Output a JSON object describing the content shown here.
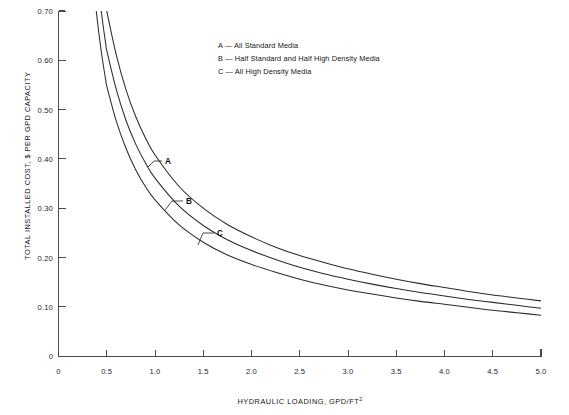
{
  "chart_data": {
    "type": "line",
    "title": "",
    "xlabel": "HYDRAULIC LOADING, GPD/FT",
    "xlabel_superscript": "2",
    "ylabel": "TOTAL INSTALLED COST, $ PER GPD CAPACITY",
    "xlim": [
      0,
      5.0
    ],
    "ylim": [
      0,
      0.7
    ],
    "grid": false,
    "legend_position": "top-center",
    "xticks": [
      "0",
      "0.5",
      "1.0",
      "1.5",
      "2.0",
      "2.5",
      "3.0",
      "3.5",
      "4.0",
      "4.5",
      "5.0"
    ],
    "xtick_values": [
      0,
      0.5,
      1.0,
      1.5,
      2.0,
      2.5,
      3.0,
      3.5,
      4.0,
      4.5,
      5.0
    ],
    "yticks": [
      "0",
      "0.10",
      "0.20",
      "0.30",
      "0.40",
      "0.50",
      "0.60",
      "0.70"
    ],
    "ytick_values": [
      0,
      0.1,
      0.2,
      0.3,
      0.4,
      0.5,
      0.6,
      0.7
    ],
    "x": [
      0.5,
      0.6,
      0.7,
      0.8,
      0.9,
      1.0,
      1.25,
      1.5,
      1.75,
      2.0,
      2.25,
      2.5,
      2.75,
      3.0,
      3.25,
      3.5,
      3.75,
      4.0,
      4.25,
      4.5,
      4.75,
      5.0
    ],
    "series": [
      {
        "name": "A",
        "label": "A — All Standard Media",
        "legend_key": "A",
        "legend_desc": "All Standard Media",
        "values": [
          0.7,
          0.61,
          0.54,
          0.486,
          0.443,
          0.408,
          0.344,
          0.3,
          0.267,
          0.242,
          0.221,
          0.204,
          0.19,
          0.177,
          0.166,
          0.156,
          0.147,
          0.139,
          0.131,
          0.124,
          0.118,
          0.112
        ]
      },
      {
        "name": "B",
        "label": "B — Half Standard and Half High Density Media",
        "legend_key": "B",
        "legend_desc": "Half Standard and Half High Density Media",
        "values": [
          0.62,
          0.54,
          0.478,
          0.43,
          0.392,
          0.361,
          0.304,
          0.265,
          0.236,
          0.214,
          0.196,
          0.18,
          0.167,
          0.156,
          0.146,
          0.137,
          0.129,
          0.122,
          0.115,
          0.109,
          0.103,
          0.097
        ]
      },
      {
        "name": "C",
        "label": "C — All High Density Media",
        "legend_key": "C",
        "legend_desc": "All High Density Media",
        "values": [
          0.548,
          0.476,
          0.421,
          0.378,
          0.344,
          0.317,
          0.266,
          0.231,
          0.205,
          0.186,
          0.17,
          0.156,
          0.144,
          0.134,
          0.126,
          0.118,
          0.111,
          0.105,
          0.099,
          0.093,
          0.088,
          0.083
        ]
      }
    ],
    "annotations": [
      {
        "text": "A",
        "x": 1.0,
        "y": 0.408
      },
      {
        "text": "B",
        "x": 1.27,
        "y": 0.302
      },
      {
        "text": "C",
        "x": 1.55,
        "y": 0.224
      }
    ]
  },
  "legend": {
    "entries": [
      "A — All Standard Media",
      "B — Half Standard and Half High Density Media",
      "C — All High Density Media"
    ]
  },
  "axes": {
    "y_title": "TOTAL INSTALLED COST, $ PER GPD CAPACITY",
    "x_title": "HYDRAULIC LOADING, GPD/FT",
    "x_title_sup": "2",
    "y_tick_labels": [
      "0.70",
      "0.60",
      "0.50",
      "0.40",
      "0.30",
      "0.20",
      "0.10",
      "0"
    ],
    "x_tick_labels": [
      "0",
      "0.5",
      "1.0",
      "1.5",
      "2.0",
      "2.5",
      "3.0",
      "3.5",
      "4.0",
      "4.5",
      "5.0"
    ]
  },
  "curve_labels": {
    "a": "A",
    "b": "B",
    "c": "C"
  },
  "colors": {
    "curve": "#2b2b2b",
    "axis": "#4a4a4a",
    "text": "#141414",
    "background": "#ffffff"
  }
}
